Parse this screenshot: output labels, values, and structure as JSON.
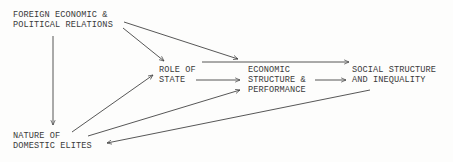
{
  "diagram": {
    "type": "causal-flow",
    "nodes": {
      "foreign": {
        "line1": "FOREIGN ECONOMIC &",
        "line2": "POLITICAL RELATIONS"
      },
      "state": {
        "line1": "ROLE OF",
        "line2": "STATE"
      },
      "economic": {
        "line1": "ECONOMIC",
        "line2": "STRUCTURE &",
        "line3": "PERFORMANCE"
      },
      "social": {
        "line1": "SOCIAL STRUCTURE",
        "line2": "AND INEQUALITY"
      },
      "elites": {
        "line1": "NATURE OF",
        "line2": "DOMESTIC ELITES"
      }
    },
    "edges": [
      {
        "from": "FOREIGN ECONOMIC & POLITICAL RELATIONS",
        "to": "ROLE OF STATE"
      },
      {
        "from": "FOREIGN ECONOMIC & POLITICAL RELATIONS",
        "to": "ECONOMIC STRUCTURE & PERFORMANCE"
      },
      {
        "from": "FOREIGN ECONOMIC & POLITICAL RELATIONS",
        "to": "NATURE OF DOMESTIC ELITES"
      },
      {
        "from": "ROLE OF STATE",
        "to": "ECONOMIC STRUCTURE & PERFORMANCE"
      },
      {
        "from": "ROLE OF STATE",
        "to": "SOCIAL STRUCTURE AND INEQUALITY"
      },
      {
        "from": "ECONOMIC STRUCTURE & PERFORMANCE",
        "to": "SOCIAL STRUCTURE AND INEQUALITY"
      },
      {
        "from": "NATURE OF DOMESTIC ELITES",
        "to": "ROLE OF STATE"
      },
      {
        "from": "NATURE OF DOMESTIC ELITES",
        "to": "ECONOMIC STRUCTURE & PERFORMANCE"
      },
      {
        "from": "SOCIAL STRUCTURE AND INEQUALITY",
        "to": "NATURE OF DOMESTIC ELITES"
      }
    ],
    "colors": {
      "text": "#3a3a3a",
      "line": "#444444",
      "background": "#fdfdfc"
    }
  }
}
